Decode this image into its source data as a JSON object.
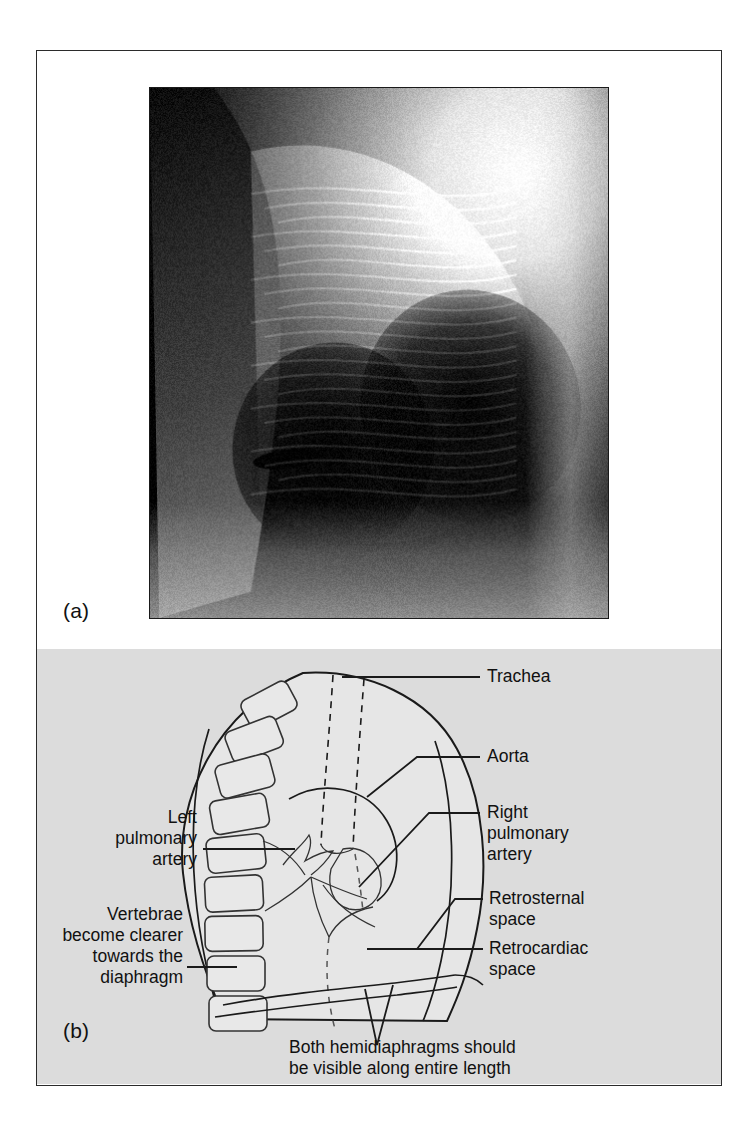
{
  "figure": {
    "panel_a_tag": "(a)",
    "panel_b_tag": "(b)",
    "background_color": "#ffffff",
    "panel_b_background": "#dcdcdc",
    "line_color": "#1a1a1a"
  },
  "panel_a": {
    "kind": "chest-radiograph-lateral",
    "alt_description": "Lateral chest X-ray showing thorax in profile"
  },
  "panel_b": {
    "kind": "line-diagram-lateral-chest",
    "labels": {
      "trachea": "Trachea",
      "aorta": "Aorta",
      "right_pulmonary_artery": "Right\npulmonary\nartery",
      "retrosternal_space": "Retrosternal\nspace",
      "retrocardiac_space": "Retrocardiac\nspace",
      "left_pulmonary_artery": "Left\npulmonary\nartery",
      "vertebrae_note": "Vertebrae\nbecome clearer\ntowards the\ndiaphragm",
      "hemidiaphragm_note": "Both hemidiaphragms should\nbe visible along entire length"
    }
  }
}
